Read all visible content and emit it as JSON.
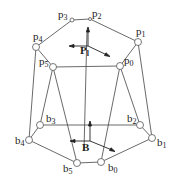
{
  "diagram": {
    "type": "stewart-platform",
    "platform_joints": [
      {
        "id": "p0",
        "label": "p",
        "sub": "0",
        "x": 120,
        "y": 66,
        "lx": 124,
        "ly": 62
      },
      {
        "id": "p1",
        "label": "p",
        "sub": "1",
        "x": 138,
        "y": 42,
        "lx": 135,
        "ly": 33
      },
      {
        "id": "p2",
        "label": "p",
        "sub": "2",
        "x": 90,
        "y": 19,
        "lx": 92,
        "ly": 17
      },
      {
        "id": "p3",
        "label": "p",
        "sub": "3",
        "x": 72,
        "y": 20,
        "lx": 58,
        "ly": 19
      },
      {
        "id": "p4",
        "label": "p",
        "sub": "4",
        "x": 36,
        "y": 47,
        "lx": 33,
        "ly": 41
      },
      {
        "id": "p5",
        "label": "p",
        "sub": "5",
        "x": 53,
        "y": 67,
        "lx": 39,
        "ly": 64
      }
    ],
    "base_joints": [
      {
        "id": "b0",
        "label": "b",
        "sub": "0",
        "x": 101,
        "y": 162,
        "lx": 108,
        "ly": 170
      },
      {
        "id": "b1",
        "label": "b",
        "sub": "1",
        "x": 152,
        "y": 138,
        "lx": 155,
        "ly": 146
      },
      {
        "id": "b2",
        "label": "b",
        "sub": "2",
        "x": 140,
        "y": 125,
        "lx": 128,
        "ly": 120
      },
      {
        "id": "b3",
        "label": "b",
        "sub": "3",
        "x": 40,
        "y": 125,
        "lx": 46,
        "ly": 121
      },
      {
        "id": "b4",
        "label": "b",
        "sub": "4",
        "x": 29,
        "y": 140,
        "lx": 14,
        "ly": 146
      },
      {
        "id": "b5",
        "label": "b",
        "sub": "5",
        "x": 77,
        "y": 163,
        "lx": 63,
        "ly": 175
      }
    ],
    "legs": [
      [
        "p4",
        "b4"
      ],
      [
        "p5",
        "b3"
      ],
      [
        "p5",
        "b5"
      ],
      [
        "p0",
        "b0"
      ],
      [
        "p0",
        "b2"
      ],
      [
        "p1",
        "b1"
      ]
    ],
    "platform_frame": {
      "label": "P",
      "sub": "l",
      "x": 86,
      "y": 50
    },
    "base_frame": {
      "label": "B",
      "x": 88,
      "y": 150
    },
    "colors": {
      "line": "#444444",
      "joint": "#555555",
      "background": "#ffffff"
    }
  }
}
